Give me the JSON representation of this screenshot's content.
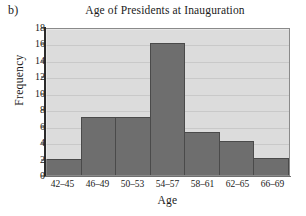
{
  "panel": {
    "label": "b)"
  },
  "chart_data": {
    "type": "bar",
    "title": "Age of Presidents at Inauguration",
    "xlabel": "Age",
    "ylabel": "Frequency",
    "categories": [
      "42–45",
      "46–49",
      "50–53",
      "54–57",
      "58–61",
      "62–65",
      "66–69"
    ],
    "values": [
      2,
      7,
      7,
      16,
      5.2,
      4.1,
      2.1
    ],
    "ylim": [
      0,
      18
    ],
    "ytick_labels": [
      "18",
      "16",
      "14",
      "12",
      "10",
      "8",
      "6",
      "4",
      "2",
      "0"
    ],
    "ytick_values": [
      18,
      16,
      14,
      12,
      10,
      8,
      6,
      4,
      2,
      0
    ],
    "ytick_step": 2,
    "grid": true,
    "legend": false,
    "colors": {
      "bar_fill": "#6e6e6e",
      "bar_edge": "#4a4a4a",
      "plot_background": "#dcdcdc",
      "gridline": "#c9c9c9",
      "axis": "#2b2b2b",
      "text": "#1a1a1a"
    }
  }
}
